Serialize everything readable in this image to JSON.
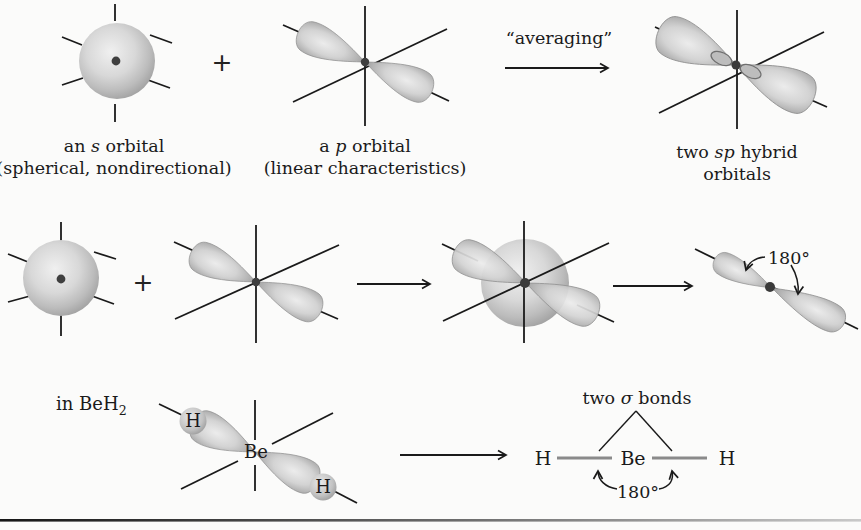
{
  "figure": {
    "background": "#fbfbfa",
    "ink_color": "#1a1a1a",
    "bond_color": "#8a8a8a",
    "orbital_gray": "#c4c4c4"
  },
  "row1": {
    "plus_sign": "+",
    "averaging_label": "“averaging”",
    "s_label": {
      "pre": "an ",
      "italic": "s",
      "post": " orbital"
    },
    "s_sublabel": "(spherical, nondirectional)",
    "p_label": {
      "pre": "a ",
      "italic": "p",
      "post": " orbital"
    },
    "p_sublabel": "(linear characteristics)",
    "sp_label": {
      "pre": "two ",
      "italic": "sp",
      "post": " hybrid"
    },
    "sp_label_line2": "orbitals"
  },
  "row2": {
    "plus_sign": "+",
    "angle_label": "180°"
  },
  "row3": {
    "context_label": {
      "text": "in BeH",
      "subscript": "2"
    },
    "orbital_diagram": {
      "h_left": "H",
      "be": "Be",
      "h_right": "H"
    },
    "sigma_label": {
      "pre": "two ",
      "italic": "σ",
      "post": " bonds"
    },
    "structure": {
      "h_left": "H",
      "be": "Be",
      "h_right": "H"
    },
    "angle_label": "180°"
  }
}
